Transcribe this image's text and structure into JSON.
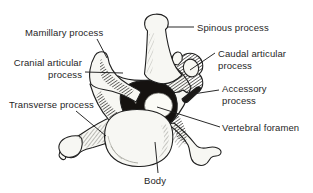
{
  "labels": {
    "mamillary": "Mamillary process",
    "spinous": "Spinous process",
    "cranial_articular": "Cranial articular\nprocess",
    "caudal_articular": "Caudal articular\nprocess",
    "accessory": "Accessory\nprocess",
    "transverse": "Transverse process",
    "vertebral_foramen": "Vertebral foramen",
    "body": "Body"
  },
  "colors": {
    "ink": "#1f1f1f",
    "background": "#ffffff",
    "bone_fill": "#f7f7f3",
    "foramen_dark": "#151210"
  }
}
